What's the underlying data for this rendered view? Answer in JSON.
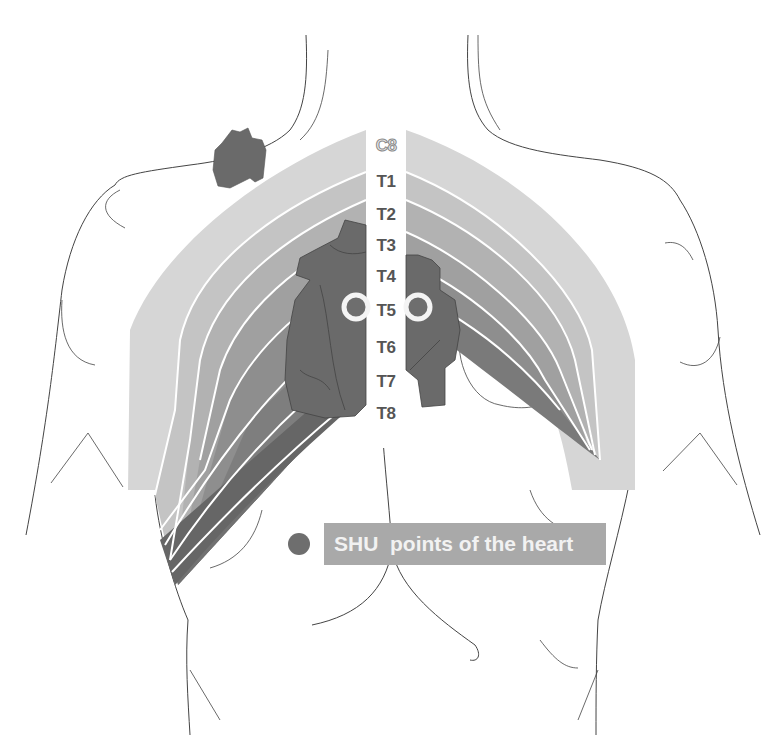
{
  "diagram": {
    "vertebra_labels": [
      "C8",
      "T1",
      "T2",
      "T3",
      "T4",
      "T5",
      "T6",
      "T7",
      "T8"
    ],
    "legend": {
      "marker": "dark-gray-dot",
      "text": "SHU  points of the heart"
    },
    "colors": {
      "band_c8": "#d6d6d6",
      "band_t1": "#c4c4c4",
      "band_t2": "#b2b2b2",
      "band_t3": "#a0a0a0",
      "band_t4": "#8e8e8e",
      "band_t5": "#7e7e7e",
      "band_t6": "#717171",
      "band_t7": "#666666",
      "heart": "#6a6a6a",
      "shu_point": "#6e6e6e",
      "legend_bg": "#a9a9a9",
      "outline": "#444444"
    }
  }
}
